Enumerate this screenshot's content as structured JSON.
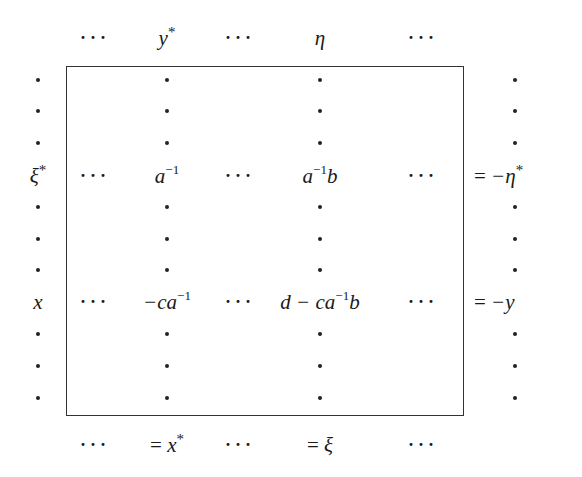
{
  "diagram": {
    "type": "block-matrix-relation",
    "top_labels": [
      {
        "id": "top-dots-1",
        "text": "···"
      },
      {
        "id": "top-y-star",
        "base": "y",
        "sup": "*"
      },
      {
        "id": "top-dots-2",
        "text": "···"
      },
      {
        "id": "top-eta",
        "base": "η"
      },
      {
        "id": "top-dots-3",
        "text": "···"
      }
    ],
    "left_labels": [
      {
        "id": "left-xi-star",
        "base": "ξ",
        "sup": "*",
        "row": 3
      },
      {
        "id": "left-x",
        "base": "x",
        "row": 7
      }
    ],
    "cells": {
      "row_xi_star": {
        "dots_1": "···",
        "entry_1": {
          "base": "a",
          "sup": "−1"
        },
        "dots_2": "···",
        "entry_2": {
          "base": "a",
          "sup": "−1",
          "tail": "b"
        },
        "dots_3": "···"
      },
      "row_x": {
        "dots_1": "···",
        "entry_1": {
          "prefix": "−ca",
          "sup": "−1"
        },
        "dots_2": "···",
        "entry_2": {
          "prefix": "d − ca",
          "sup": "−1",
          "tail": "b"
        },
        "dots_3": "···"
      }
    },
    "right_labels": [
      {
        "id": "right-neg-eta-star",
        "eq": "=",
        "base": "−η",
        "sup": "*",
        "row": 3
      },
      {
        "id": "right-neg-y",
        "eq": "=",
        "base": "−y",
        "row": 7
      }
    ],
    "bottom_labels": [
      {
        "id": "bottom-dots-1",
        "text": "···"
      },
      {
        "id": "bottom-eq-x-star",
        "eq": "=",
        "base": "x",
        "sup": "*"
      },
      {
        "id": "bottom-dots-2",
        "text": "···"
      },
      {
        "id": "bottom-eq-xi",
        "eq": "=",
        "base": "ξ"
      },
      {
        "id": "bottom-dots-3",
        "text": "···"
      }
    ],
    "grid": {
      "rows": 11,
      "row_y": [
        80,
        111,
        143,
        176,
        207,
        239,
        270,
        302,
        334,
        366,
        398
      ],
      "dot_columns_x": [
        38,
        167,
        320,
        515
      ],
      "labeled_rows": [
        3,
        7
      ]
    },
    "colors": {
      "ink": "#1a1a1a",
      "border": "#333333",
      "background": "#ffffff"
    }
  }
}
